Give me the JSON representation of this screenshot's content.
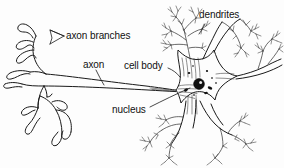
{
  "figure": {
    "style": "black-and-white line drawing",
    "background_color": "#fdfdfd",
    "ink_color": "#1a1a1a",
    "width": 284,
    "height": 168
  },
  "labels": {
    "axon_branches": "axon branches",
    "axon": "axon",
    "cell_body": "cell body",
    "nucleus": "nucleus",
    "dendrites": "dendrites"
  },
  "parts": [
    {
      "name": "axon-branches",
      "label": "axon branches",
      "description": "tube-like terminal branches fanning out on the left end of the axon"
    },
    {
      "name": "axon",
      "label": "axon",
      "description": "long narrow double-lined tube running horizontally from the cell body to the left"
    },
    {
      "name": "cell-body",
      "label": "cell body",
      "description": "star-shaped soma at centre-right containing the nucleus and dark organelles"
    },
    {
      "name": "nucleus",
      "label": "nucleus",
      "description": "dark filled circle with a pale nucleolus inside the cell body"
    },
    {
      "name": "dendrites",
      "label": "dendrites",
      "description": "feathery finely branched trees radiating from the cell body"
    }
  ]
}
